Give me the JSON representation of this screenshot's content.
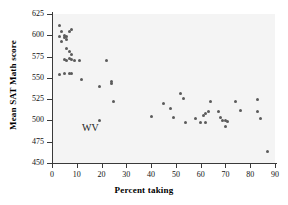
{
  "chart_data": {
    "type": "scatter",
    "title": "",
    "xlabel": "Percent taking",
    "ylabel": "Mean SAT Math score",
    "xlim": [
      0,
      90
    ],
    "ylim": [
      450,
      625
    ],
    "xticks": [
      0,
      10,
      20,
      30,
      40,
      50,
      60,
      70,
      80,
      90
    ],
    "yticks": [
      450,
      475,
      500,
      525,
      550,
      575,
      600,
      625
    ],
    "grid": false,
    "legend": null,
    "marker_color": "#5b5b5b",
    "plot_background": "#f4f4f4",
    "axis_color": "#3a3a3a",
    "annotations": [
      {
        "text": "WV",
        "x": 15.5,
        "y": 492
      }
    ],
    "points": [
      {
        "x": 3,
        "y": 611
      },
      {
        "x": 3,
        "y": 598
      },
      {
        "x": 4,
        "y": 593
      },
      {
        "x": 4,
        "y": 604
      },
      {
        "x": 5,
        "y": 600
      },
      {
        "x": 5,
        "y": 597
      },
      {
        "x": 6,
        "y": 599
      },
      {
        "x": 6,
        "y": 595
      },
      {
        "x": 7,
        "y": 604
      },
      {
        "x": 8,
        "y": 607
      },
      {
        "x": 6,
        "y": 585
      },
      {
        "x": 7,
        "y": 581
      },
      {
        "x": 8,
        "y": 578
      },
      {
        "x": 5,
        "y": 572
      },
      {
        "x": 6,
        "y": 570
      },
      {
        "x": 7,
        "y": 573
      },
      {
        "x": 8,
        "y": 571
      },
      {
        "x": 9,
        "y": 570
      },
      {
        "x": 11,
        "y": 570
      },
      {
        "x": 3,
        "y": 554
      },
      {
        "x": 5,
        "y": 555
      },
      {
        "x": 7,
        "y": 555
      },
      {
        "x": 8,
        "y": 555
      },
      {
        "x": 12,
        "y": 548
      },
      {
        "x": 19,
        "y": 540
      },
      {
        "x": 19,
        "y": 500
      },
      {
        "x": 22,
        "y": 570
      },
      {
        "x": 24,
        "y": 546
      },
      {
        "x": 24,
        "y": 543
      },
      {
        "x": 25,
        "y": 522
      },
      {
        "x": 40,
        "y": 505
      },
      {
        "x": 45,
        "y": 520
      },
      {
        "x": 48,
        "y": 514
      },
      {
        "x": 49,
        "y": 504
      },
      {
        "x": 52,
        "y": 532
      },
      {
        "x": 53,
        "y": 526
      },
      {
        "x": 54,
        "y": 497
      },
      {
        "x": 58,
        "y": 502
      },
      {
        "x": 60,
        "y": 497
      },
      {
        "x": 61,
        "y": 506
      },
      {
        "x": 62,
        "y": 508
      },
      {
        "x": 62,
        "y": 498
      },
      {
        "x": 63,
        "y": 511
      },
      {
        "x": 64,
        "y": 522
      },
      {
        "x": 67,
        "y": 511
      },
      {
        "x": 68,
        "y": 503
      },
      {
        "x": 69,
        "y": 500
      },
      {
        "x": 70,
        "y": 500
      },
      {
        "x": 70,
        "y": 493
      },
      {
        "x": 71,
        "y": 499
      },
      {
        "x": 74,
        "y": 522
      },
      {
        "x": 76,
        "y": 512
      },
      {
        "x": 83,
        "y": 524
      },
      {
        "x": 83,
        "y": 511
      },
      {
        "x": 84,
        "y": 502
      },
      {
        "x": 87,
        "y": 464
      }
    ]
  }
}
